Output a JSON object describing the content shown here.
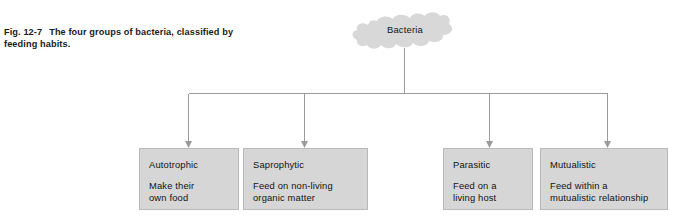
{
  "figure": {
    "caption_label": "Fig. 12-7",
    "caption_text": "The four groups of bacteria, classified by feeding habits.",
    "caption_line1": "The four groups of bacteria,",
    "caption_line2": "classified by feeding habits."
  },
  "root": {
    "label": "Bacteria",
    "shape": "cloud",
    "fill_color": "#d8d8d8"
  },
  "colors": {
    "box_fill": "#d6d6d6",
    "box_border": "#b9b9b9",
    "connector": "#9a9a9a",
    "text": "#121212",
    "background": "#ffffff"
  },
  "branches": [
    {
      "title": "Autotrophic",
      "description": "Make their\nown food"
    },
    {
      "title": "Saprophytic",
      "description": "Feed on non-living\norganic matter"
    },
    {
      "title": "Parasitic",
      "description": "Feed on a\nliving host"
    },
    {
      "title": "Mutualistic",
      "description": "Feed within a\nmutualistic relationship"
    }
  ]
}
